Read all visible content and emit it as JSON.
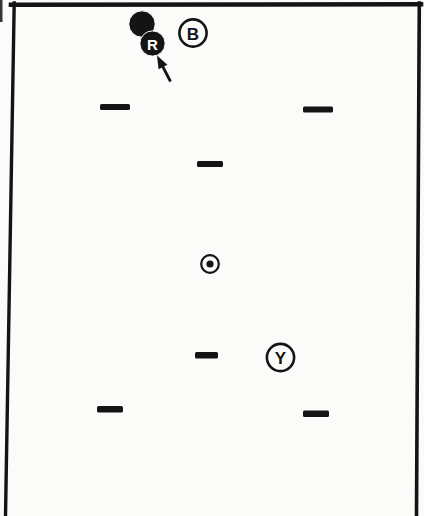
{
  "page": {
    "background": "#fbfbfa",
    "ink": "#141414"
  },
  "figure": {
    "canvas": {
      "width": 424,
      "height": 516
    },
    "frame": {
      "top": {
        "x1": 11,
        "y1": 4.7,
        "x2": 421,
        "y2": 4.3,
        "stroke_width": 4.6
      },
      "left": {
        "x1": 14.2,
        "y1": 3,
        "x2": 5.5,
        "y2": 516,
        "stroke_width": 3.4
      },
      "right": {
        "x1": 419.3,
        "y1": 3,
        "x2": 416.5,
        "y2": 516,
        "stroke_width": 3.6
      }
    },
    "scan_artifact": {
      "x": 0,
      "y": 0,
      "width": 2.5,
      "height": 22
    },
    "balls": [
      {
        "id": "black-ball",
        "label": "",
        "cx": 142,
        "cy": 24,
        "r": 13.2,
        "label_color": "#ffffff",
        "font_size": 15
      },
      {
        "id": "ball-R",
        "label": "R",
        "cx": 152.5,
        "cy": 43.5,
        "r": 12.6,
        "label_color": "#ffffff",
        "font_size": 15
      }
    ],
    "ring_markers": [
      {
        "id": "marker-B",
        "label": "B",
        "cx": 193,
        "cy": 33,
        "r": 13.6,
        "stroke_width": 2.6,
        "font_size": 17
      },
      {
        "id": "marker-Y",
        "label": "Y",
        "cx": 280.5,
        "cy": 357.5,
        "r": 13.6,
        "stroke_width": 2.6,
        "font_size": 17
      }
    ],
    "spot": {
      "cx": 210,
      "cy": 264,
      "outer_r": 8.8,
      "ring_width": 2.2,
      "dot_r": 3.6
    },
    "dashes": [
      {
        "id": "dash-upper-left",
        "x": 100,
        "y": 104,
        "width": 30,
        "height": 6
      },
      {
        "id": "dash-upper-right",
        "x": 303,
        "y": 106.5,
        "width": 30,
        "height": 6
      },
      {
        "id": "dash-upper-center",
        "x": 197,
        "y": 161,
        "width": 26,
        "height": 6
      },
      {
        "id": "dash-lower-center",
        "x": 195,
        "y": 352,
        "width": 23,
        "height": 6.5
      },
      {
        "id": "dash-bottom-left",
        "x": 97,
        "y": 406,
        "width": 26,
        "height": 6.5
      },
      {
        "id": "dash-bottom-right",
        "x": 303,
        "y": 410.5,
        "width": 26,
        "height": 6.5
      }
    ],
    "arrow": {
      "tip_x": 157,
      "tip_y": 55.5,
      "tail_x": 170.5,
      "tail_y": 81.5,
      "head_length": 13,
      "head_width": 10,
      "shaft_width": 2.8
    }
  }
}
